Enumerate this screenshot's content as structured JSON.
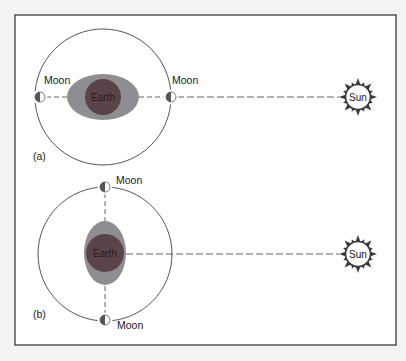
{
  "figure": {
    "frame": {
      "x": 15,
      "y": 15,
      "w": 381,
      "h": 330,
      "stroke": "#3a3a3a"
    },
    "colors": {
      "background": "#f4f4f2",
      "panel_fill": "#ffffff",
      "orbit": "#555555",
      "tide_bulge": "#8e8e92",
      "earth": "#5a4449",
      "moon_dark": "#555555",
      "sun_rays": "#3a3a3a"
    },
    "panels": [
      {
        "id": "a",
        "label": "(a)",
        "earth_label": "Earth",
        "sun_label": "Sun",
        "moon_labels": [
          "Moon",
          "Moon"
        ],
        "description": "Moons aligned with Earth and Sun (spring tide)",
        "orbit": {
          "cx": 103,
          "cy": 97,
          "r": 68
        },
        "bulge": {
          "cx": 103,
          "cy": 97,
          "rx": 36,
          "ry": 23
        },
        "earth": {
          "cx": 103,
          "cy": 97,
          "r": 18
        },
        "moons": [
          {
            "cx": 40,
            "cy": 97
          },
          {
            "cx": 171,
            "cy": 97
          }
        ],
        "sun": {
          "cx": 358,
          "cy": 97,
          "r": 12
        }
      },
      {
        "id": "b",
        "label": "(b)",
        "earth_label": "Earth",
        "sun_label": "Sun",
        "moon_labels": [
          "Moon",
          "Moon"
        ],
        "description": "Moons at right angle to Earth–Sun line (neap tide)",
        "orbit": {
          "cx": 105,
          "cy": 254,
          "r": 67
        },
        "bulge": {
          "cx": 105,
          "cy": 253,
          "rx": 21,
          "ry": 32
        },
        "earth": {
          "cx": 105,
          "cy": 253,
          "r": 19
        },
        "moons": [
          {
            "cx": 105,
            "cy": 187
          },
          {
            "cx": 105,
            "cy": 320
          }
        ],
        "sun": {
          "cx": 358,
          "cy": 254,
          "r": 12
        }
      }
    ]
  }
}
